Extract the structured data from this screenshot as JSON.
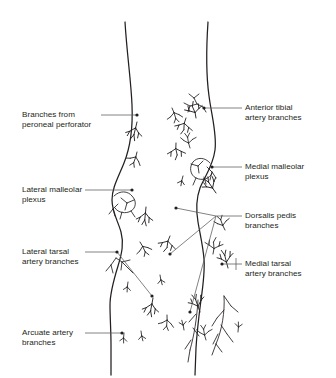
{
  "figure": {
    "ink_color": "#231f20",
    "leader_color": "#58595b",
    "background": "#ffffff",
    "view": "anterior view of two lower legs, ankles and feet"
  },
  "labels": {
    "peroneal_perforator": {
      "line1": "Branches from",
      "line2": "peroneal perforator",
      "side": "left",
      "x": 22,
      "y": 110
    },
    "lateral_malleolar": {
      "line1": "Lateral malleolar",
      "line2": "plexus",
      "side": "left",
      "x": 22,
      "y": 185
    },
    "lateral_tarsal": {
      "line1": "Lateral tarsal",
      "line2": "artery branches",
      "side": "left",
      "x": 22,
      "y": 247
    },
    "arcuate_artery": {
      "line1": "Arcuate artery",
      "line2": "branches",
      "side": "left",
      "x": 22,
      "y": 328
    },
    "anterior_tibial": {
      "line1": "Anterior tibial",
      "line2": "artery branches",
      "side": "right",
      "x": 245,
      "y": 103
    },
    "medial_malleolar": {
      "line1": "Medial malleolar",
      "line2": "plexus",
      "side": "right",
      "x": 245,
      "y": 162
    },
    "dorsalis_pedis": {
      "line1": "Dorsalis pedis",
      "line2": "branches",
      "side": "right",
      "x": 245,
      "y": 211
    },
    "medial_tarsal": {
      "line1": "Medial tarsal",
      "line2": "artery branches",
      "side": "right",
      "x": 245,
      "y": 259
    }
  }
}
